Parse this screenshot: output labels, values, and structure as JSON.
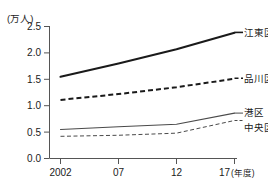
{
  "chart_data": {
    "type": "line",
    "title": "",
    "subtitle": "",
    "xlabel": "",
    "ylabel": "",
    "y_unit_label": "(万人)",
    "x_unit_label": "(年度)",
    "x": [
      2002,
      2007,
      2012,
      2017
    ],
    "categories": [
      "2002",
      "07",
      "12",
      "17"
    ],
    "xtick_labels": [
      "2002",
      "07",
      "12",
      "17"
    ],
    "xlim": [
      2002,
      2017
    ],
    "ylim": [
      0.0,
      2.5
    ],
    "ytick_labels": [
      "0.0",
      "0.5",
      "1.0",
      "1.5",
      "2.0",
      "2.5"
    ],
    "ytick_values": [
      0.0,
      0.5,
      1.0,
      1.5,
      2.0,
      2.5
    ],
    "grid": false,
    "legend_position": "right-inline-end-of-line",
    "series": [
      {
        "name": "江東区",
        "values": [
          1.55,
          1.8,
          2.07,
          2.38
        ],
        "style": "solid",
        "width": 2.1,
        "color": "#1a1a1a"
      },
      {
        "name": "品川区",
        "values": [
          1.11,
          1.22,
          1.35,
          1.51
        ],
        "style": "dashed",
        "width": 2.0,
        "color": "#1a1a1a"
      },
      {
        "name": "港区",
        "values": [
          0.55,
          0.6,
          0.65,
          0.86
        ],
        "style": "solid",
        "width": 1.1,
        "color": "#4a4a4a"
      },
      {
        "name": "中央区",
        "values": [
          0.42,
          0.44,
          0.48,
          0.72
        ],
        "style": "dashed-fine",
        "width": 1.0,
        "color": "#4a4a4a"
      }
    ]
  },
  "axes": {
    "y_unit": "(万人)",
    "x_unit": "(年度)",
    "ytick_0": "0.0",
    "ytick_1": "0.5",
    "ytick_2": "1.0",
    "ytick_3": "1.5",
    "ytick_4": "2.0",
    "ytick_5": "2.5",
    "xtick_0": "2002",
    "xtick_1": "07",
    "xtick_2": "12",
    "xtick_3": "17"
  },
  "legend": {
    "item_0": "江東区",
    "item_1": "品川区",
    "item_2": "港区",
    "item_3": "中央区"
  },
  "colors": {
    "axis": "#555555",
    "ink_dark": "#1a1a1a",
    "ink_mid": "#4a4a4a",
    "background": "#ffffff"
  }
}
